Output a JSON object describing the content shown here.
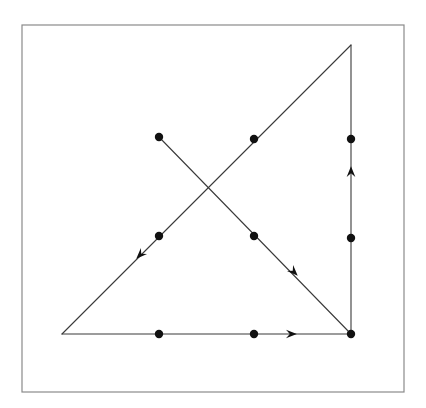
{
  "figure": {
    "type": "line-diagram",
    "canvas": {
      "width": 426,
      "height": 408,
      "background": "#ffffff"
    },
    "style": {
      "stroke_color": "#3a3a3a",
      "stroke_width": 1.1,
      "frame_color": "#8a8a8a",
      "frame_width": 1.2,
      "dot_color": "#111111",
      "dot_radius": 4.2,
      "arrow_color": "#111111",
      "arrow_size": 7
    },
    "frame": {
      "x": 22,
      "y": 25,
      "width": 382,
      "height": 367
    },
    "vertices": [
      {
        "name": "bottom-left",
        "x": 62,
        "y": 334
      },
      {
        "name": "bottom-right",
        "x": 351,
        "y": 334
      },
      {
        "name": "top-right",
        "x": 351,
        "y": 45
      },
      {
        "name": "upper-left-endpoint",
        "x": 159,
        "y": 137
      },
      {
        "name": "diagonal-intersection",
        "x": 207,
        "y": 187
      }
    ],
    "edges": [
      {
        "name": "bottom-edge",
        "from": {
          "x": 62,
          "y": 334
        },
        "to": {
          "x": 351,
          "y": 334
        },
        "direction": "rightward"
      },
      {
        "name": "right-edge",
        "from": {
          "x": 351,
          "y": 334
        },
        "to": {
          "x": 351,
          "y": 45
        },
        "direction": "upward"
      },
      {
        "name": "hypotenuse",
        "from": {
          "x": 351,
          "y": 45
        },
        "to": {
          "x": 62,
          "y": 334
        },
        "direction": "down-left"
      },
      {
        "name": "crossing-segment",
        "from": {
          "x": 159,
          "y": 137
        },
        "to": {
          "x": 351,
          "y": 334
        },
        "direction": "down-right"
      }
    ],
    "dots": [
      {
        "name": "dot-bottom-left-mid",
        "x": 159,
        "y": 334
      },
      {
        "name": "dot-bottom-right-mid",
        "x": 254,
        "y": 334
      },
      {
        "name": "dot-bottom-right-vertex",
        "x": 351,
        "y": 334
      },
      {
        "name": "dot-right-edge-lower",
        "x": 351,
        "y": 238
      },
      {
        "name": "dot-right-edge-upper",
        "x": 351,
        "y": 139
      },
      {
        "name": "dot-hypotenuse-upper",
        "x": 254,
        "y": 139
      },
      {
        "name": "dot-hypotenuse-lower",
        "x": 159,
        "y": 236
      },
      {
        "name": "dot-crossing-upper-end",
        "x": 159,
        "y": 137
      },
      {
        "name": "dot-crossing-lower",
        "x": 254,
        "y": 236
      }
    ],
    "arrows": [
      {
        "name": "arrow-bottom-edge",
        "x": 293,
        "y": 334,
        "angle_deg": 0
      },
      {
        "name": "arrow-right-edge",
        "x": 351,
        "y": 170,
        "angle_deg": -90
      },
      {
        "name": "arrow-hypotenuse",
        "x": 139,
        "y": 256,
        "angle_deg": 135
      },
      {
        "name": "arrow-crossing-segment",
        "x": 295,
        "y": 273,
        "angle_deg": 45
      }
    ]
  }
}
